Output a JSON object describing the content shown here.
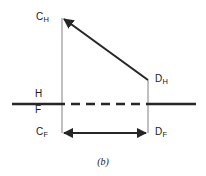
{
  "figure": {
    "caption": "(b)",
    "type": "descriptive-geometry-projection-diagram",
    "stroke_color": "#262626",
    "background_color": "#ffffff"
  },
  "labels": {
    "c_h": {
      "base": "C",
      "sub": "H"
    },
    "d_h": {
      "base": "D",
      "sub": "H"
    },
    "c_f": {
      "base": "C",
      "sub": "F"
    },
    "d_f": {
      "base": "D",
      "sub": "F"
    },
    "horizontal_plane": "H",
    "frontal_plane": "F"
  },
  "geometry": {
    "points": {
      "c_h": {
        "x": 62,
        "y": 18
      },
      "d_h": {
        "x": 148,
        "y": 80
      },
      "c_f": {
        "x": 62,
        "y": 133
      },
      "d_f": {
        "x": 148,
        "y": 133
      }
    },
    "reference_line": {
      "name": "HF-fold-line",
      "y": 104,
      "x_start": 12,
      "x_end": 196,
      "solid_left_end": 62,
      "solid_right_start": 148,
      "dash_pattern": "9 6"
    },
    "segments": [
      {
        "name": "top-view-line-CH-DH",
        "from": "c_h",
        "to": "d_h",
        "arrow_at": "start"
      },
      {
        "name": "front-view-line-CF-DF",
        "from": "c_f",
        "to": "d_f",
        "arrow_at": "both"
      },
      {
        "name": "projector-C",
        "from": "c_h",
        "to": "c_f",
        "style": "thin"
      },
      {
        "name": "projector-D",
        "from": "d_h",
        "to": "d_f",
        "style": "thin"
      }
    ]
  }
}
